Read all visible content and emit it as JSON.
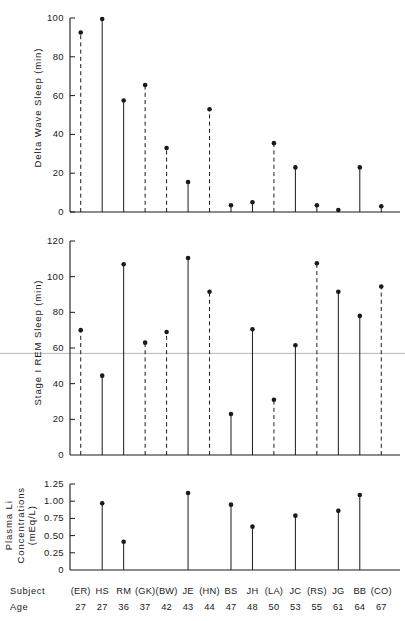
{
  "figure": {
    "background": "#ffffff",
    "ink": "#1a1a1a",
    "reference_line_color": "#b4b4b4"
  },
  "axis_rows": {
    "subject_label": "Subject",
    "age_label": "Age"
  },
  "subjects": [
    {
      "code": "(ER)",
      "age": "27"
    },
    {
      "code": "HS",
      "age": "27"
    },
    {
      "code": "RM",
      "age": "36"
    },
    {
      "code": "(GK)",
      "age": "37"
    },
    {
      "code": "(BW)",
      "age": "42"
    },
    {
      "code": "JE",
      "age": "43"
    },
    {
      "code": "(HN)",
      "age": "44"
    },
    {
      "code": "BS",
      "age": "47"
    },
    {
      "code": "JH",
      "age": "48"
    },
    {
      "code": "(LA)",
      "age": "50"
    },
    {
      "code": "JC",
      "age": "53"
    },
    {
      "code": "(RS)",
      "age": "55"
    },
    {
      "code": "JG",
      "age": "61"
    },
    {
      "code": "BB",
      "age": "64"
    },
    {
      "code": "(CO)",
      "age": "67"
    }
  ],
  "chart_data": [
    {
      "type": "scatter",
      "panel": "delta-wave-sleep",
      "title": "",
      "xlabel": "",
      "ylabel": "Delta Wave Sleep (min)",
      "ylim": [
        0,
        100
      ],
      "yticks": [
        0,
        20,
        40,
        60,
        80,
        100
      ],
      "yticklabels": [
        "0",
        "20",
        "40",
        "60",
        "80",
        "100"
      ],
      "grid": false,
      "categories": [
        "(ER)",
        "HS",
        "RM",
        "(GK)",
        "(BW)",
        "JE",
        "(HN)",
        "BS",
        "JH",
        "(LA)",
        "JC",
        "(RS)",
        "JG",
        "BB",
        "(CO)"
      ],
      "values": [
        92.5,
        99.5,
        57.5,
        65.5,
        33.0,
        15.5,
        53.0,
        3.5,
        5.0,
        35.5,
        23.0,
        3.5,
        1.0,
        23.0,
        3.0
      ],
      "stem_styles": [
        "dashed",
        "solid",
        "solid",
        "dashed",
        "dashed",
        "solid",
        "dashed",
        "solid",
        "solid",
        "dashed",
        "solid",
        "solid",
        "solid",
        "solid",
        "solid"
      ]
    },
    {
      "type": "scatter",
      "panel": "stage-i-rem-sleep",
      "title": "",
      "xlabel": "",
      "ylabel": "Stage I REM Sleep (min)",
      "ylim": [
        0,
        120
      ],
      "yticks": [
        20,
        40,
        60,
        80,
        100,
        120
      ],
      "yticklabels": [
        "20",
        "40",
        "60",
        "80",
        "100",
        "120"
      ],
      "reference_line_y": 57,
      "grid": false,
      "categories": [
        "(ER)",
        "HS",
        "RM",
        "(GK)",
        "(BW)",
        "JE",
        "(HN)",
        "BS",
        "JH",
        "(LA)",
        "JC",
        "(RS)",
        "JG",
        "BB",
        "(CO)"
      ],
      "values": [
        70.0,
        44.5,
        107.0,
        63.0,
        69.0,
        110.5,
        91.5,
        23.0,
        70.5,
        31.0,
        61.5,
        107.5,
        91.5,
        78.0,
        94.5
      ],
      "stem_styles": [
        "dashed",
        "solid",
        "solid",
        "dashed",
        "dashed",
        "solid",
        "dashed",
        "solid",
        "solid",
        "dashed",
        "solid",
        "dashed",
        "solid",
        "solid",
        "dashed"
      ]
    },
    {
      "type": "scatter",
      "panel": "plasma-li-concentrations",
      "title": "",
      "xlabel": "",
      "ylabel": "Plasma Li Concentrations (mEq/L)",
      "ylim": [
        0,
        1.25
      ],
      "yticks": [
        0.25,
        0.5,
        0.75,
        1.0,
        1.25
      ],
      "yticklabels": [
        "0.25",
        "0.50",
        "0.75",
        "1.00",
        "1.25"
      ],
      "grid": false,
      "categories": [
        "(ER)",
        "HS",
        "RM",
        "(GK)",
        "(BW)",
        "JE",
        "(HN)",
        "BS",
        "JH",
        "(LA)",
        "JC",
        "(RS)",
        "JG",
        "BB",
        "(CO)"
      ],
      "values": [
        null,
        0.97,
        0.41,
        null,
        null,
        1.12,
        null,
        0.95,
        0.63,
        null,
        0.79,
        null,
        0.86,
        1.09,
        null
      ],
      "stem_styles": [
        "solid",
        "solid",
        "solid",
        "solid",
        "solid",
        "solid",
        "solid",
        "solid",
        "solid",
        "solid",
        "solid",
        "solid",
        "solid",
        "solid",
        "solid"
      ]
    }
  ]
}
